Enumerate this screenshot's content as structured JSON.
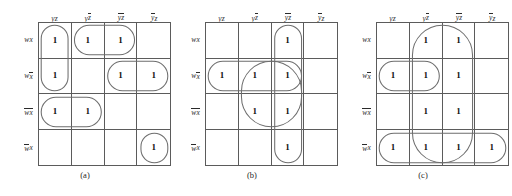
{
  "figure": {
    "colors": {
      "grid_line": "#5b5b5b",
      "group_outline": "#6e6e6e",
      "background": "#ffffff",
      "text": "#1a1a1a"
    }
  },
  "common": {
    "column_headers": [
      {
        "plain": "yz",
        "y_bar": false,
        "z_bar": false
      },
      {
        "plain": "yz'",
        "y_bar": false,
        "z_bar": true
      },
      {
        "plain": "y'z'",
        "y_bar": true,
        "z_bar": true
      },
      {
        "plain": "y'z",
        "y_bar": true,
        "z_bar": false
      }
    ],
    "row_headers": [
      {
        "plain": "wx",
        "w_bar": false,
        "x_bar": false
      },
      {
        "plain": "wx'",
        "w_bar": false,
        "x_bar": true
      },
      {
        "plain": "w'x'",
        "w_bar": true,
        "x_bar": true
      },
      {
        "plain": "w'x",
        "w_bar": true,
        "x_bar": false
      }
    ],
    "one_label": "1"
  },
  "maps": [
    {
      "id": "map-a",
      "caption": "(a)",
      "cells": [
        [
          "1",
          "1",
          "1",
          ""
        ],
        [
          "1",
          "",
          "1",
          "1"
        ],
        [
          "1",
          "1",
          "",
          ""
        ],
        [
          "",
          "",
          "",
          "1"
        ]
      ],
      "groups": [
        {
          "name": "group-col1-rows1-2",
          "col": 0,
          "row": 0,
          "cols": 1,
          "rows": 2
        },
        {
          "name": "group-row1-cols2-3",
          "col": 1,
          "row": 0,
          "cols": 2,
          "rows": 1
        },
        {
          "name": "group-row2-cols3-4",
          "col": 2,
          "row": 1,
          "cols": 2,
          "rows": 1
        },
        {
          "name": "group-row3-cols1-2",
          "col": 0,
          "row": 2,
          "cols": 2,
          "rows": 1
        },
        {
          "name": "group-row4-col4",
          "col": 3,
          "row": 3,
          "cols": 1,
          "rows": 1
        }
      ]
    },
    {
      "id": "map-b",
      "caption": "(b)",
      "cells": [
        [
          "",
          "",
          "1",
          ""
        ],
        [
          "1",
          "1",
          "1",
          ""
        ],
        [
          "",
          "1",
          "1",
          ""
        ],
        [
          "",
          "",
          "1",
          ""
        ]
      ],
      "groups": [
        {
          "name": "group-col3-rows1-4",
          "col": 2,
          "row": 0,
          "cols": 1,
          "rows": 4
        },
        {
          "name": "group-row2-cols1-3",
          "col": 0,
          "row": 1,
          "cols": 3,
          "rows": 1
        },
        {
          "name": "group-cols2-3-rows2-3",
          "col": 1,
          "row": 1,
          "cols": 2,
          "rows": 2
        }
      ]
    },
    {
      "id": "map-c",
      "caption": "(c)",
      "cells": [
        [
          "",
          "1",
          "1",
          ""
        ],
        [
          "1",
          "1",
          "1",
          ""
        ],
        [
          "",
          "1",
          "1",
          ""
        ],
        [
          "1",
          "1",
          "1",
          "1"
        ]
      ],
      "groups": [
        {
          "name": "group-cols2-3-rows1-4",
          "col": 1,
          "row": 0,
          "cols": 2,
          "rows": 4
        },
        {
          "name": "group-row2-cols1-2",
          "col": 0,
          "row": 1,
          "cols": 2,
          "rows": 1
        },
        {
          "name": "group-row4-cols1-4",
          "col": 0,
          "row": 3,
          "cols": 4,
          "rows": 1
        }
      ]
    }
  ]
}
